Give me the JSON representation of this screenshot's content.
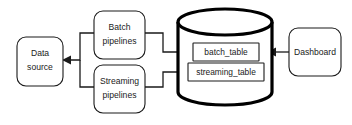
{
  "diagram": {
    "type": "data-pipeline-architecture",
    "background_color": "#ffffff",
    "stroke_color": "#1a1a1a",
    "cylinder_stroke_color": "#000000",
    "nodes": {
      "data_source": {
        "label_line1": "Data",
        "label_line2": "source",
        "shape": "rounded-rectangle"
      },
      "batch_pipelines": {
        "label_line1": "Batch",
        "label_line2": "pipelines",
        "shape": "rounded-rectangle"
      },
      "streaming_pipelines": {
        "label_line1": "Streaming",
        "label_line2": "pipelines",
        "shape": "rounded-rectangle"
      },
      "database": {
        "shape": "cylinder",
        "tables": [
          {
            "label": "batch_table"
          },
          {
            "label": "streaming_table"
          }
        ]
      },
      "dashboard": {
        "label_line1": "Dashboard",
        "shape": "rounded-rectangle"
      }
    },
    "edges": [
      {
        "from": "batch_pipelines",
        "to": "data_source",
        "arrow": "left"
      },
      {
        "from": "streaming_pipelines",
        "to": "data_source",
        "arrow": "left"
      },
      {
        "from": "batch_pipelines",
        "to": "batch_table",
        "arrow": "right"
      },
      {
        "from": "streaming_pipelines",
        "to": "streaming_table",
        "arrow": "right"
      },
      {
        "from": "dashboard",
        "to": "database",
        "arrow": "left"
      }
    ]
  }
}
